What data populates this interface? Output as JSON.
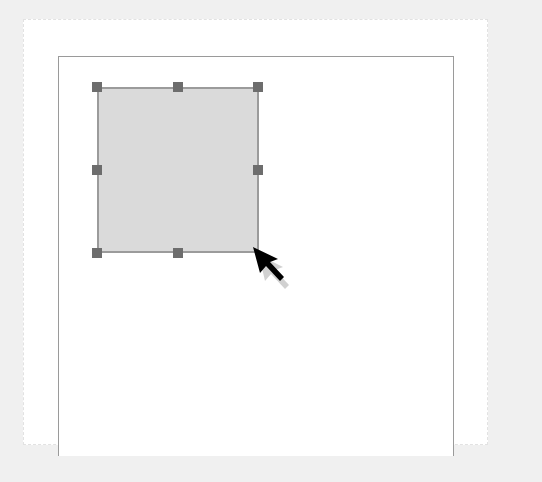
{
  "canvas": {
    "background": "#f0f0f0",
    "page_color": "#ffffff",
    "frame_color": "#9a9a9a"
  },
  "shape": {
    "type": "rectangle",
    "fill": "#dadada",
    "stroke": "#9b9b9b",
    "selected": true,
    "handles": [
      "top-left",
      "top-center",
      "top-right",
      "middle-left",
      "middle-right",
      "bottom-left",
      "bottom-center",
      "bottom-right"
    ]
  },
  "cursor": {
    "icon": "arrow-pointer-icon",
    "color": "#000000"
  }
}
